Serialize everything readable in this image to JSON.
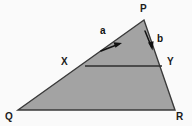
{
  "figure": {
    "kind": "geometry-diagram",
    "colors": {
      "background": "#fafafa",
      "fill": "#a3a3a3",
      "stroke": "#3a3a3a",
      "label": "#1c1c1c"
    },
    "canvas": {
      "width": 192,
      "height": 126
    },
    "vertices": [
      {
        "id": "P",
        "label": "P",
        "x": 144,
        "y": 20,
        "label_x": 140,
        "label_y": 5
      },
      {
        "id": "Q",
        "label": "Q",
        "x": 18,
        "y": 110,
        "label_x": 6,
        "label_y": 113
      },
      {
        "id": "R",
        "label": "R",
        "x": 175,
        "y": 110,
        "label_x": 177,
        "label_y": 113
      },
      {
        "id": "X",
        "label": "X",
        "x": 85,
        "y": 66,
        "label_x": 62,
        "label_y": 57
      },
      {
        "id": "Y",
        "label": "Y",
        "x": 162,
        "y": 66,
        "label_x": 168,
        "label_y": 57
      }
    ],
    "edges": [
      {
        "id": "PQ",
        "from": "P",
        "to": "Q"
      },
      {
        "id": "PR",
        "from": "P",
        "to": "R"
      },
      {
        "id": "QR",
        "from": "Q",
        "to": "R"
      },
      {
        "id": "XY",
        "from": "X",
        "to": "Y",
        "style": "horizontal-chord"
      }
    ],
    "arrows": [
      {
        "id": "a",
        "label": "a",
        "on_edge": "QP",
        "direction": "towards-P",
        "tail_x": 101,
        "tail_y": 51,
        "tip_x": 119,
        "tip_y": 44,
        "label_x": 101,
        "label_y": 27
      },
      {
        "id": "b",
        "label": "b",
        "on_edge": "PR",
        "direction": "towards-R",
        "tail_x": 145,
        "tail_y": 31,
        "tip_x": 152,
        "tip_y": 49,
        "label_x": 158,
        "label_y": 35
      }
    ]
  }
}
